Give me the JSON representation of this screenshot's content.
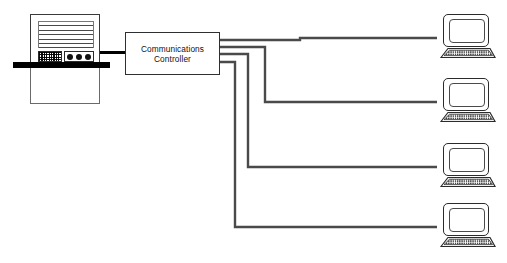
{
  "diagram": {
    "background": "#ffffff",
    "line_color": "#4a4a4a",
    "stroke_color": "#2b2b2b",
    "accent_color": "#000000",
    "canvas": {
      "width": 507,
      "height": 263
    }
  },
  "host": {
    "name": "mainframe-computer",
    "icon": "mainframe-icon",
    "slat_count": 6,
    "led_count": 3,
    "has_keypad": true,
    "floor_bar": true
  },
  "controller": {
    "label": "Communications\nController",
    "label_line_1": "Communications",
    "label_line_2": "Controller",
    "name": "communications-controller"
  },
  "links": {
    "host_to_controller": {
      "name": "host-link",
      "style": "thick-solid"
    },
    "controller_to_terminals": [
      {
        "name": "terminal-link-1",
        "exit_y": 40,
        "drop_x": 300,
        "target_y": 38
      },
      {
        "name": "terminal-link-2",
        "exit_y": 47,
        "drop_x": 265,
        "target_y": 102
      },
      {
        "name": "terminal-link-3",
        "exit_y": 54,
        "drop_x": 248,
        "target_y": 167
      },
      {
        "name": "terminal-link-4",
        "exit_y": 62,
        "drop_x": 235,
        "target_y": 227
      }
    ]
  },
  "terminals": [
    {
      "name": "terminal-1",
      "icon": "computer-terminal-icon",
      "x": 435,
      "y": 14
    },
    {
      "name": "terminal-2",
      "icon": "computer-terminal-icon",
      "x": 435,
      "y": 78
    },
    {
      "name": "terminal-3",
      "icon": "computer-terminal-icon",
      "x": 435,
      "y": 143
    },
    {
      "name": "terminal-4",
      "icon": "computer-terminal-icon",
      "x": 435,
      "y": 203
    }
  ]
}
